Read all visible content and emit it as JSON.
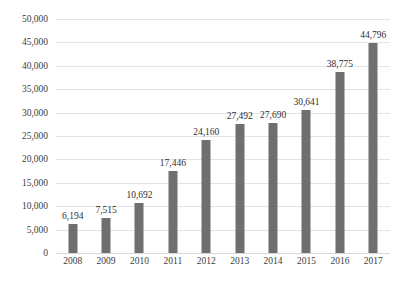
{
  "chart_data": {
    "type": "bar",
    "title": "",
    "subtitle": "",
    "xlabel": "",
    "ylabel": "",
    "categories": [
      "2008",
      "2009",
      "2010",
      "2011",
      "2012",
      "2013",
      "2014",
      "2015",
      "2016",
      "2017"
    ],
    "values": [
      6194,
      7515,
      10692,
      17446,
      24160,
      27492,
      27690,
      30641,
      38775,
      44796
    ],
    "data_labels": [
      "6,194",
      "7,515",
      "10,692",
      "17,446",
      "24,160",
      "27,492",
      "27,690",
      "30,641",
      "38,775",
      "44,796"
    ],
    "ylim": [
      0,
      50000
    ],
    "ytick_step": 5000,
    "ytick_labels": [
      "0",
      "5,000",
      "10,000",
      "15,000",
      "20,000",
      "25,000",
      "30,000",
      "35,000",
      "40,000",
      "45,000",
      "50,000"
    ],
    "ytick_values": [
      0,
      5000,
      10000,
      15000,
      20000,
      25000,
      30000,
      35000,
      40000,
      45000,
      50000
    ],
    "grid": "horizontal",
    "legend": "none",
    "legend_position": "none",
    "series": [
      {
        "name": "",
        "values": [
          6194,
          7515,
          10692,
          17446,
          24160,
          27492,
          27690,
          30641,
          38775,
          44796
        ],
        "color": "#6f6f6f"
      }
    ],
    "colors": {
      "bar": "#6f6f6f",
      "gridline": "#e3e3e3",
      "text": "#3d3d3d",
      "background": "#ffffff"
    }
  }
}
